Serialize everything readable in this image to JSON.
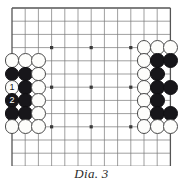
{
  "caption": "Dia. 3",
  "board": {
    "type": "go-board-diagram",
    "cell_size": 13.2,
    "origin_x": 12,
    "origin_y": 8,
    "cols": 13,
    "rows": 13,
    "line_color": "#777777",
    "edge_color": "#555555",
    "star_color": "#3a3a3a",
    "star_points": [
      {
        "col": 3,
        "row": 3
      },
      {
        "col": 6,
        "row": 3
      },
      {
        "col": 9,
        "row": 3
      },
      {
        "col": 3,
        "row": 6
      },
      {
        "col": 6,
        "row": 6
      },
      {
        "col": 9,
        "row": 6
      },
      {
        "col": 3,
        "row": 9
      },
      {
        "col": 6,
        "row": 9
      },
      {
        "col": 9,
        "row": 9
      }
    ]
  },
  "colors": {
    "black_stone": "#17161a",
    "white_stone": "#fdfdfb",
    "stone_outline": "#4a4a4a",
    "caption_text": "#2b2b2b"
  },
  "stones": [
    {
      "id": "w-l-c0-r4",
      "color": "white",
      "col": 0,
      "row": 4,
      "label": ""
    },
    {
      "id": "w-l-c1-r4",
      "color": "white",
      "col": 1,
      "row": 4,
      "label": ""
    },
    {
      "id": "w-l-c2-r4",
      "color": "white",
      "col": 2,
      "row": 4,
      "label": ""
    },
    {
      "id": "b-l-c0-r5",
      "color": "black",
      "col": 0,
      "row": 5,
      "label": ""
    },
    {
      "id": "b-l-c1-r5",
      "color": "black",
      "col": 1,
      "row": 5,
      "label": ""
    },
    {
      "id": "w-l-c2-r5",
      "color": "white",
      "col": 2,
      "row": 5,
      "label": ""
    },
    {
      "id": "w-move-1",
      "color": "white",
      "col": 0,
      "row": 6,
      "label": "1"
    },
    {
      "id": "b-l-c1-r6",
      "color": "black",
      "col": 1,
      "row": 6,
      "label": ""
    },
    {
      "id": "w-l-c2-r6",
      "color": "white",
      "col": 2,
      "row": 6,
      "label": ""
    },
    {
      "id": "b-move-2",
      "color": "black",
      "col": 0,
      "row": 7,
      "label": "2"
    },
    {
      "id": "b-l-c1-r7",
      "color": "black",
      "col": 1,
      "row": 7,
      "label": ""
    },
    {
      "id": "w-l-c2-r7",
      "color": "white",
      "col": 2,
      "row": 7,
      "label": ""
    },
    {
      "id": "b-l-c0-r8",
      "color": "black",
      "col": 0,
      "row": 8,
      "label": ""
    },
    {
      "id": "b-l-c1-r8",
      "color": "black",
      "col": 1,
      "row": 8,
      "label": ""
    },
    {
      "id": "w-l-c2-r8",
      "color": "white",
      "col": 2,
      "row": 8,
      "label": ""
    },
    {
      "id": "w-l-c0-r9",
      "color": "white",
      "col": 0,
      "row": 9,
      "label": ""
    },
    {
      "id": "w-l-c1-r9",
      "color": "white",
      "col": 1,
      "row": 9,
      "label": ""
    },
    {
      "id": "w-l-c2-r9",
      "color": "white",
      "col": 2,
      "row": 9,
      "label": ""
    },
    {
      "id": "w-r-c10-r3",
      "color": "white",
      "col": 10,
      "row": 3,
      "label": ""
    },
    {
      "id": "w-r-c11-r3",
      "color": "white",
      "col": 11,
      "row": 3,
      "label": ""
    },
    {
      "id": "w-r-c12-r3",
      "color": "white",
      "col": 12,
      "row": 3,
      "label": ""
    },
    {
      "id": "w-r-c10-r4",
      "color": "white",
      "col": 10,
      "row": 4,
      "label": ""
    },
    {
      "id": "b-r-c11-r4",
      "color": "black",
      "col": 11,
      "row": 4,
      "label": ""
    },
    {
      "id": "b-r-c12-r4",
      "color": "black",
      "col": 12,
      "row": 4,
      "label": ""
    },
    {
      "id": "w-r-c10-r5",
      "color": "white",
      "col": 10,
      "row": 5,
      "label": ""
    },
    {
      "id": "b-r-c11-r5",
      "color": "black",
      "col": 11,
      "row": 5,
      "label": ""
    },
    {
      "id": "w-r-c10-r6",
      "color": "white",
      "col": 10,
      "row": 6,
      "label": ""
    },
    {
      "id": "b-r-c11-r6",
      "color": "black",
      "col": 11,
      "row": 6,
      "label": ""
    },
    {
      "id": "b-r-c12-r6",
      "color": "black",
      "col": 12,
      "row": 6,
      "label": ""
    },
    {
      "id": "w-r-c10-r7",
      "color": "white",
      "col": 10,
      "row": 7,
      "label": ""
    },
    {
      "id": "b-r-c11-r7",
      "color": "black",
      "col": 11,
      "row": 7,
      "label": ""
    },
    {
      "id": "w-r-c10-r8",
      "color": "white",
      "col": 10,
      "row": 8,
      "label": ""
    },
    {
      "id": "b-r-c11-r8",
      "color": "black",
      "col": 11,
      "row": 8,
      "label": ""
    },
    {
      "id": "b-r-c12-r8",
      "color": "black",
      "col": 12,
      "row": 8,
      "label": ""
    },
    {
      "id": "w-r-c10-r9",
      "color": "white",
      "col": 10,
      "row": 9,
      "label": ""
    },
    {
      "id": "w-r-c11-r9",
      "color": "white",
      "col": 11,
      "row": 9,
      "label": ""
    },
    {
      "id": "w-r-c12-r9",
      "color": "white",
      "col": 12,
      "row": 9,
      "label": ""
    }
  ]
}
